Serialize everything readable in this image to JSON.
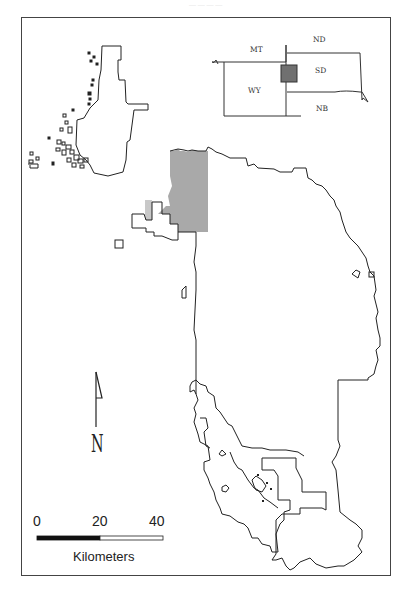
{
  "caption": "— — — —",
  "inset_map": {
    "states": [
      {
        "label": "MT"
      },
      {
        "label": "ND"
      },
      {
        "label": "SD"
      },
      {
        "label": "WY"
      },
      {
        "label": "NB"
      }
    ],
    "highlight_color": "#707070"
  },
  "main_map": {
    "highlight_fill": "#a9a9a9",
    "outline_color": "#222222"
  },
  "north_arrow": {
    "label": "N"
  },
  "scale_bar": {
    "ticks": [
      "0",
      "20",
      "40"
    ],
    "unit": "Kilometers"
  }
}
